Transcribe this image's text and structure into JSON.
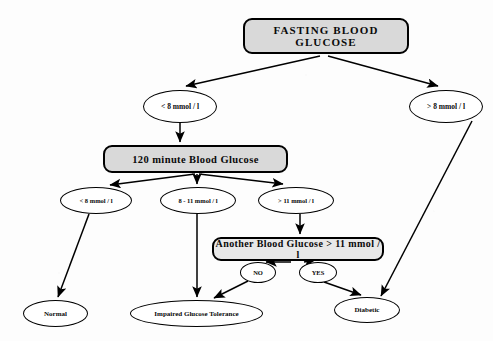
{
  "diagram": {
    "type": "flowchart",
    "background_color": "#fdfdfd",
    "node_fill_box": "#d9d9d9",
    "node_fill_ellipse": "#ffffff",
    "stroke_color": "#000000",
    "nodes": [
      {
        "id": "fasting",
        "label": "FASTING  BLOOD  GLUCOSE",
        "shape": "rounded-rect",
        "x": 243,
        "y": 18,
        "w": 166,
        "h": 36
      },
      {
        "id": "lt8",
        "label": "< 8 mmol / l",
        "shape": "ellipse",
        "x": 143,
        "y": 90,
        "w": 74,
        "h": 33
      },
      {
        "id": "gt8",
        "label": "> 8 mmol / l",
        "shape": "ellipse",
        "x": 409,
        "y": 90,
        "w": 74,
        "h": 33
      },
      {
        "id": "min120",
        "label": "120 minute Blood Glucose",
        "shape": "rounded-rect",
        "x": 103,
        "y": 145,
        "w": 185,
        "h": 28
      },
      {
        "id": "lt8b",
        "label": "< 8 mmol / l",
        "shape": "ellipse",
        "x": 60,
        "y": 187,
        "w": 72,
        "h": 27
      },
      {
        "id": "mid811",
        "label": "8 - 11 mmol / l",
        "shape": "ellipse",
        "x": 160,
        "y": 187,
        "w": 76,
        "h": 27
      },
      {
        "id": "gt11",
        "label": "> 11 mmol / l",
        "shape": "ellipse",
        "x": 258,
        "y": 187,
        "w": 76,
        "h": 27
      },
      {
        "id": "another",
        "label": "Another Blood Glucose > 11 mmol / l",
        "shape": "rounded-rect",
        "x": 212,
        "y": 237,
        "w": 172,
        "h": 24
      },
      {
        "id": "no",
        "label": "NO",
        "shape": "ellipse",
        "x": 240,
        "y": 262,
        "w": 36,
        "h": 21
      },
      {
        "id": "yes",
        "label": "YES",
        "shape": "ellipse",
        "x": 299,
        "y": 262,
        "w": 38,
        "h": 21
      },
      {
        "id": "normal",
        "label": "Normal",
        "shape": "ellipse",
        "x": 23,
        "y": 300,
        "w": 65,
        "h": 27
      },
      {
        "id": "igt",
        "label": "Impaired Glucose Tolerance",
        "shape": "ellipse",
        "x": 130,
        "y": 300,
        "w": 133,
        "h": 27
      },
      {
        "id": "diabetic",
        "label": "Diabetic",
        "shape": "ellipse",
        "x": 334,
        "y": 297,
        "w": 66,
        "h": 26
      }
    ],
    "edges": [
      {
        "from": "fasting",
        "to": "lt8",
        "style": "arrow"
      },
      {
        "from": "fasting",
        "to": "gt8",
        "style": "arrow"
      },
      {
        "from": "lt8",
        "to": "min120",
        "style": "arrow"
      },
      {
        "from": "min120",
        "to": "lt8b",
        "style": "arrow"
      },
      {
        "from": "min120",
        "to": "mid811",
        "style": "arrow"
      },
      {
        "from": "min120",
        "to": "gt11",
        "style": "arrow"
      },
      {
        "from": "lt8b",
        "to": "normal",
        "style": "arrow"
      },
      {
        "from": "mid811",
        "to": "igt",
        "style": "arrow"
      },
      {
        "from": "gt11",
        "to": "another",
        "style": "arrow"
      },
      {
        "from": "another",
        "to": "no",
        "style": "arrow"
      },
      {
        "from": "another",
        "to": "yes",
        "style": "arrow"
      },
      {
        "from": "no",
        "to": "igt",
        "style": "arrow"
      },
      {
        "from": "yes",
        "to": "diabetic",
        "style": "arrow"
      },
      {
        "from": "gt8",
        "to": "diabetic",
        "style": "arrow"
      }
    ]
  }
}
